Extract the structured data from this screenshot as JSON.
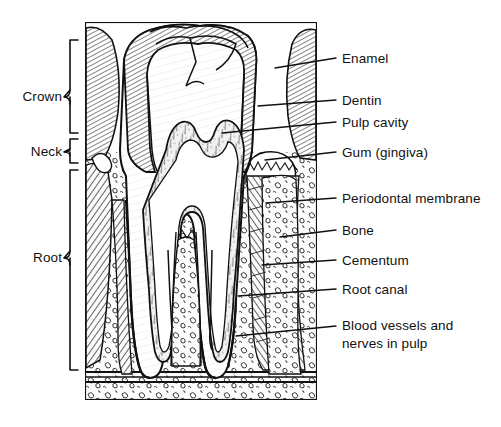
{
  "figure": {
    "type": "anatomical-line-diagram",
    "background_color": "#ffffff",
    "ink_color": "#111111"
  },
  "region_labels": [
    {
      "id": "crown",
      "label": "Crown",
      "bracket_top": 40,
      "bracket_bottom": 133,
      "text_x": 13,
      "text_y": 97
    },
    {
      "id": "neck",
      "label": "Neck",
      "bracket_top": 139,
      "bracket_bottom": 163,
      "text_x": 22,
      "text_y": 152
    },
    {
      "id": "root",
      "label": "Root",
      "bracket_top": 170,
      "bracket_bottom": 370,
      "text_x": 24,
      "text_y": 258
    }
  ],
  "callout_labels": [
    {
      "id": "enamel",
      "label": "Enamel",
      "text_x": 342,
      "text_y": 51,
      "leader_from_x": 275,
      "leader_from_y": 68,
      "leader_to_x": 336,
      "leader_to_y": 58
    },
    {
      "id": "dentin",
      "label": "Dentin",
      "text_x": 342,
      "text_y": 93,
      "leader_from_x": 258,
      "leader_from_y": 106,
      "leader_to_x": 336,
      "leader_to_y": 100
    },
    {
      "id": "pulp-cavity",
      "label": "Pulp cavity",
      "text_x": 342,
      "text_y": 115,
      "leader_from_x": 222,
      "leader_from_y": 133,
      "leader_to_x": 336,
      "leader_to_y": 122
    },
    {
      "id": "gum-gingiva",
      "label": "Gum (gingiva)",
      "text_x": 342,
      "text_y": 145,
      "leader_from_x": 265,
      "leader_from_y": 160,
      "leader_to_x": 336,
      "leader_to_y": 152
    },
    {
      "id": "periodontal-membrane",
      "label": "Periodontal membrane",
      "text_x": 342,
      "text_y": 191,
      "leader_from_x": 266,
      "leader_from_y": 203,
      "leader_to_x": 336,
      "leader_to_y": 198
    },
    {
      "id": "bone",
      "label": "Bone",
      "text_x": 342,
      "text_y": 223,
      "leader_from_x": 280,
      "leader_from_y": 237,
      "leader_to_x": 336,
      "leader_to_y": 230
    },
    {
      "id": "cementum",
      "label": "Cementum",
      "text_x": 342,
      "text_y": 253,
      "leader_from_x": 262,
      "leader_from_y": 265,
      "leader_to_x": 336,
      "leader_to_y": 260
    },
    {
      "id": "root-canal",
      "label": "Root canal",
      "text_x": 342,
      "text_y": 282,
      "leader_from_x": 238,
      "leader_from_y": 296,
      "leader_to_x": 336,
      "leader_to_y": 289
    },
    {
      "id": "blood-vessels-nerves",
      "label": "Blood vessels and\nnerves in pulp",
      "line1": "Blood vessels and",
      "line2": "nerves in pulp",
      "text_x": 342,
      "text_y": 318,
      "leader_from_x": 236,
      "leader_from_y": 336,
      "leader_to_x": 336,
      "leader_to_y": 326
    }
  ],
  "structures": [
    {
      "id": "enamel-layer",
      "name": "Enamel",
      "fill_pattern": "fine-diagonal-hatch",
      "description": "Outer hatched cap over the crown"
    },
    {
      "id": "dentin-body",
      "name": "Dentin",
      "fill_pattern": "blank",
      "description": "Large unshaded body beneath enamel"
    },
    {
      "id": "pulp-chamber",
      "name": "Pulp cavity",
      "fill_pattern": "stipple-fiber",
      "description": "Central chamber with fibrous stipple"
    },
    {
      "id": "root-canal-channel",
      "name": "Root canal",
      "fill_pattern": "fine-line",
      "description": "Narrow channel descending through each root"
    },
    {
      "id": "cementum-layer",
      "name": "Cementum",
      "fill_pattern": "thin-outline",
      "description": "Thin layer coating the root surface"
    },
    {
      "id": "periodontal-ligament",
      "name": "Periodontal membrane",
      "fill_pattern": "radial-hatch",
      "description": "Radiating hatch between root and bone"
    },
    {
      "id": "alveolar-bone",
      "name": "Bone",
      "fill_pattern": "trabecular-squiggle",
      "description": "Spongy bone with looped trabecular texture"
    },
    {
      "id": "gingiva",
      "name": "Gum (gingiva)",
      "fill_pattern": "scalloped-edge",
      "description": "Soft tissue collar at the neck"
    }
  ]
}
